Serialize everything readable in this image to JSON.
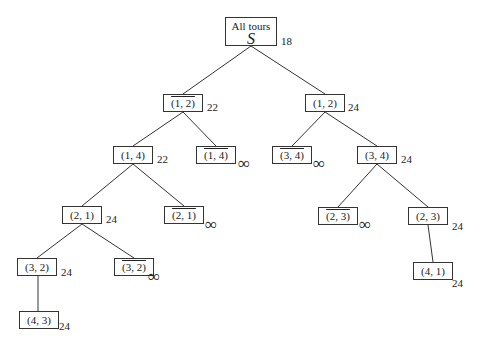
{
  "root": {
    "label": "All tours",
    "symbol": "S",
    "cost": "18"
  },
  "nodes": [
    {
      "id": "n12bar",
      "label": "(1, 2)",
      "negated": true,
      "cost": "22"
    },
    {
      "id": "n12",
      "label": "(1, 2)",
      "negated": false,
      "cost": "24"
    },
    {
      "id": "n14",
      "label": "(1, 4)",
      "negated": false,
      "cost": "22"
    },
    {
      "id": "n14bar",
      "label": "(1, 4)",
      "negated": true,
      "cost": "∞"
    },
    {
      "id": "n34bar",
      "label": "(3, 4)",
      "negated": true,
      "cost": "∞"
    },
    {
      "id": "n34",
      "label": "(3, 4)",
      "negated": false,
      "cost": "24"
    },
    {
      "id": "n21",
      "label": "(2, 1)",
      "negated": false,
      "cost": "24"
    },
    {
      "id": "n21bar",
      "label": "(2, 1)",
      "negated": true,
      "cost": "∞"
    },
    {
      "id": "n23bar",
      "label": "(2, 3)",
      "negated": true,
      "cost": "∞"
    },
    {
      "id": "n23",
      "label": "(2, 3)",
      "negated": false,
      "cost": "24"
    },
    {
      "id": "n32",
      "label": "(3, 2)",
      "negated": false,
      "cost": "24"
    },
    {
      "id": "n32bar",
      "label": "(3, 2)",
      "negated": true,
      "cost": "∞"
    },
    {
      "id": "n41",
      "label": "(4, 1)",
      "negated": false,
      "cost": "24"
    },
    {
      "id": "n43",
      "label": "(4, 3)",
      "negated": false,
      "cost": "24"
    }
  ],
  "edges": [
    [
      "root",
      "n12bar"
    ],
    [
      "root",
      "n12"
    ],
    [
      "n12bar",
      "n14"
    ],
    [
      "n12bar",
      "n14bar"
    ],
    [
      "n12",
      "n34bar"
    ],
    [
      "n12",
      "n34"
    ],
    [
      "n14",
      "n21"
    ],
    [
      "n14",
      "n21bar"
    ],
    [
      "n34",
      "n23bar"
    ],
    [
      "n34",
      "n23"
    ],
    [
      "n21",
      "n32"
    ],
    [
      "n21",
      "n32bar"
    ],
    [
      "n23",
      "n41"
    ],
    [
      "n32",
      "n43"
    ]
  ]
}
